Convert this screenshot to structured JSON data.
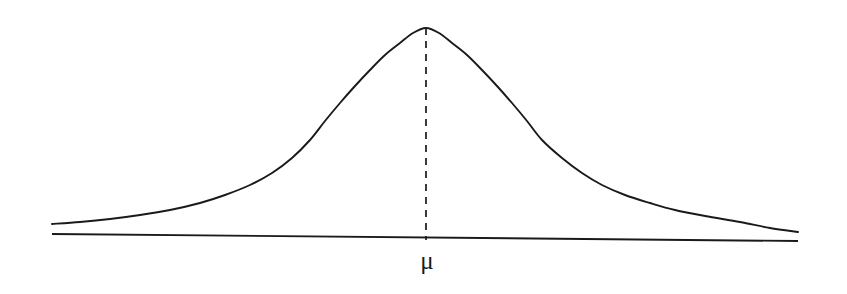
{
  "figure": {
    "kind": "normal-distribution-curve",
    "background_color": "#ffffff",
    "ink_color": "#1a1a1a",
    "width": 847,
    "height": 294
  },
  "labels": {
    "mean_symbol": "μ",
    "mean_label_x": 427,
    "mean_label_y": 248
  },
  "chart_data": {
    "type": "line",
    "title": "",
    "subtitle": "",
    "xlabel": "",
    "ylabel": "",
    "grid": false,
    "legend": null,
    "annotations": [
      {
        "name": "mean-marker",
        "text": "μ",
        "x": 426,
        "style": "dashed-vertical-line",
        "from_y": 28,
        "to_y": 240
      }
    ],
    "axis": {
      "baseline": true,
      "ticks": [],
      "tick_labels": [],
      "x_start": 52,
      "x_end": 798,
      "y_start": 234,
      "y_end": 241
    },
    "distribution": {
      "name": "normal",
      "mean_pixel_x": 426,
      "peak_pixel_y": 28,
      "baseline_pixel_y": 237,
      "sigma_pixel": 92
    },
    "x": [
      52,
      80,
      110,
      140,
      170,
      200,
      225,
      250,
      272,
      292,
      310,
      325,
      340,
      355,
      370,
      385,
      400,
      413,
      426,
      439,
      452,
      467,
      482,
      497,
      512,
      527,
      542,
      562,
      582,
      602,
      625,
      650,
      675,
      705,
      740,
      770,
      798
    ],
    "values": [
      224,
      222,
      219,
      215,
      210,
      203,
      195,
      185,
      173,
      158,
      140,
      121,
      103,
      86,
      70,
      55,
      43,
      33,
      28,
      33,
      43,
      55,
      70,
      86,
      103,
      121,
      140,
      158,
      173,
      185,
      195,
      203,
      210,
      216,
      222,
      228,
      232
    ],
    "series": [
      {
        "name": "probability-density",
        "values": [
          224,
          222,
          219,
          215,
          210,
          203,
          195,
          185,
          173,
          158,
          140,
          121,
          103,
          86,
          70,
          55,
          43,
          33,
          28,
          33,
          43,
          55,
          70,
          86,
          103,
          121,
          140,
          158,
          173,
          185,
          195,
          203,
          210,
          216,
          222,
          228,
          232
        ]
      }
    ],
    "note_axes_are_pixel_coordinates": true
  }
}
